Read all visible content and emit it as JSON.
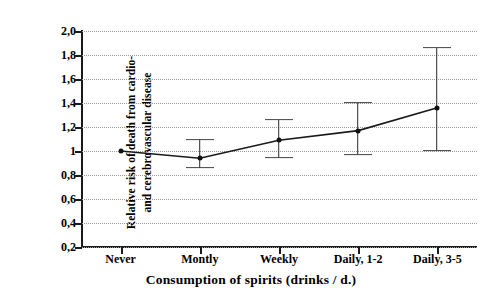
{
  "chart_data": {
    "type": "line",
    "title": "",
    "subtitle": "",
    "xlabel": "Consumption of spirits (drinks / d.)",
    "ylabel": "Relative risk of death from cardio- and cerebrovascular disease",
    "ylabel_line1": "Relative risk of death from cardio-",
    "ylabel_line2": "and cerebrovascular disease",
    "categories": [
      "Never",
      "Montly",
      "Weekly",
      "Daily, 1-2",
      "Daily, 3-5"
    ],
    "values": [
      1.0,
      0.94,
      1.09,
      1.17,
      1.36
    ],
    "error_low": [
      1.0,
      0.86,
      0.94,
      0.97,
      1.0
    ],
    "error_high": [
      1.0,
      1.09,
      1.26,
      1.4,
      1.86
    ],
    "has_error_bars": [
      false,
      true,
      true,
      true,
      true
    ],
    "ylim": [
      0.2,
      2.0
    ],
    "ytick_values": [
      2.0,
      1.8,
      1.6,
      1.4,
      1.2,
      1.0,
      0.8,
      0.6,
      0.4,
      0.2
    ],
    "ytick_labels": [
      "2,0",
      "1,8",
      "1,6",
      "1,4",
      "1,2",
      "1",
      "0,8",
      "0,6",
      "0,4",
      "0,2"
    ],
    "grid": true,
    "grid_style": "dotted-horizontal",
    "legend": null,
    "legend_position": "none",
    "series": [
      {
        "name": "Relative risk",
        "values": [
          1.0,
          0.94,
          1.09,
          1.17,
          1.36
        ],
        "color": "#1a1a1a",
        "marker": "dot"
      }
    ],
    "annotations": [],
    "colors": {
      "line": "#1a1a1a",
      "marker": "#111111",
      "error_bar": "#2b2b2b",
      "error_cap": "#444444",
      "axis": "#1a1a1a",
      "grid": "#9a9a9a",
      "background": "#ffffff",
      "text": "#000000"
    }
  }
}
